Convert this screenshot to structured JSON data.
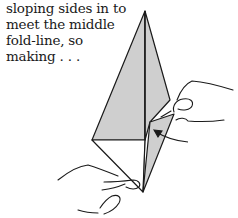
{
  "caption": {
    "lines": [
      "sloping sides in to",
      "meet the middle",
      "fold-line, so",
      "making . . ."
    ]
  },
  "illustration": {
    "subject": "hands folding paper kite shape (origami step)",
    "paper_fill": "#cfcfcf",
    "line_color": "#1a1a1a",
    "arrow": "fold-direction-arrow"
  }
}
